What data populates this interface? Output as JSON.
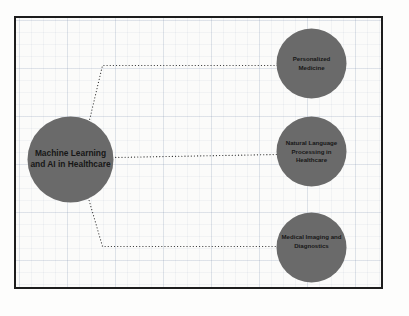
{
  "diagram": {
    "type": "node-link-mindmap",
    "canvas": {
      "width": 409,
      "height": 316
    },
    "style": {
      "node_fill": "#6a6a6a",
      "node_text_color": "#171717",
      "edge_color": "#2a2a2a",
      "edge_style": "dotted",
      "frame_border_color": "#1d1d1d",
      "frame_background": "#fbfbfa",
      "grid_line_color": "#788caa",
      "page_background": "#fdfdfc"
    },
    "hub": {
      "id": "hub",
      "label_lines": [
        "Machine Learning",
        "and AI in Healthcare"
      ],
      "cx": 71,
      "cy": 160,
      "r": 43
    },
    "leaves": [
      {
        "id": "personalized-medicine",
        "label_lines": [
          "Personalized",
          "Medicine"
        ],
        "cx": 312,
        "cy": 64,
        "r": 35,
        "text_dy": 0
      },
      {
        "id": "nlp-healthcare",
        "label_lines": [
          "Natural Language",
          "Processing in",
          "Healthcare"
        ],
        "cx": 312,
        "cy": 152,
        "r": 35,
        "text_dy": 0
      },
      {
        "id": "medical-imaging",
        "label_lines": [
          "Medical Imaging and",
          "Diagnostics"
        ],
        "cx": 312,
        "cy": 248,
        "r": 35,
        "text_dy": -6
      }
    ],
    "edges": [
      {
        "id": "edge-hub-personalized-medicine",
        "from": "hub",
        "to": "personalized-medicine",
        "points": "88,129 103,66 279,66"
      },
      {
        "id": "edge-hub-nlp-healthcare",
        "from": "hub",
        "to": "nlp-healthcare",
        "points": "113,158 277,155"
      },
      {
        "id": "edge-hub-medical-imaging",
        "from": "hub",
        "to": "medical-imaging",
        "points": "87,192 103,247 278,247"
      }
    ]
  }
}
